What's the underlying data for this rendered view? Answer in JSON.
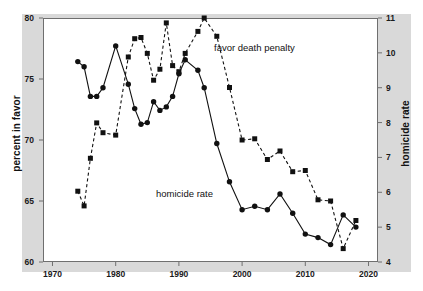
{
  "chart_data": {
    "type": "line",
    "title": "",
    "subtitle": "",
    "xlabel": "",
    "xlim": [
      1968.5,
      2021.5
    ],
    "xticks": [
      1970,
      1980,
      1990,
      2000,
      2010,
      2020
    ],
    "grid": false,
    "legend_position": "inline-annotations",
    "axes": [
      {
        "id": "left",
        "label": "percent in favor",
        "ylim": [
          60,
          80
        ],
        "yticks": [
          60,
          65,
          70,
          75,
          80
        ],
        "side": "left"
      },
      {
        "id": "right",
        "label": "homicide rate",
        "ylim": [
          4,
          11
        ],
        "yticks": [
          4,
          5,
          6,
          7,
          8,
          9,
          10,
          11
        ],
        "side": "right"
      }
    ],
    "series": [
      {
        "name": "favor death penalty",
        "axis": "left",
        "marker": "square",
        "linestyle": "dashed",
        "color": "#111111",
        "annotation": "favor death penalty",
        "points": [
          {
            "x": 1974,
            "y": 65.8
          },
          {
            "x": 1975,
            "y": 64.6
          },
          {
            "x": 1976,
            "y": 68.5
          },
          {
            "x": 1977,
            "y": 71.4
          },
          {
            "x": 1978,
            "y": 70.6
          },
          {
            "x": 1980,
            "y": 70.4
          },
          {
            "x": 1982,
            "y": 76.8
          },
          {
            "x": 1983,
            "y": 78.3
          },
          {
            "x": 1984,
            "y": 78.4
          },
          {
            "x": 1985,
            "y": 77.1
          },
          {
            "x": 1986,
            "y": 74.9
          },
          {
            "x": 1987,
            "y": 75.8
          },
          {
            "x": 1988,
            "y": 79.6
          },
          {
            "x": 1989,
            "y": 76.1
          },
          {
            "x": 1990,
            "y": 75.6
          },
          {
            "x": 1991,
            "y": 77.1
          },
          {
            "x": 1993,
            "y": 78.9
          },
          {
            "x": 1994,
            "y": 80.0
          },
          {
            "x": 1996,
            "y": 78.5
          },
          {
            "x": 1998,
            "y": 74.3
          },
          {
            "x": 2000,
            "y": 70.0
          },
          {
            "x": 2002,
            "y": 70.1
          },
          {
            "x": 2004,
            "y": 68.4
          },
          {
            "x": 2006,
            "y": 69.1
          },
          {
            "x": 2008,
            "y": 67.4
          },
          {
            "x": 2010,
            "y": 67.5
          },
          {
            "x": 2012,
            "y": 65.1
          },
          {
            "x": 2014,
            "y": 65.0
          },
          {
            "x": 2016,
            "y": 61.1
          },
          {
            "x": 2018,
            "y": 63.4
          }
        ]
      },
      {
        "name": "homicide rate",
        "axis": "right",
        "marker": "circle",
        "linestyle": "solid",
        "color": "#111111",
        "annotation": "homicide rate",
        "points": [
          {
            "x": 1974,
            "y": 9.75
          },
          {
            "x": 1975,
            "y": 9.6
          },
          {
            "x": 1976,
            "y": 8.75
          },
          {
            "x": 1977,
            "y": 8.75
          },
          {
            "x": 1978,
            "y": 9.0
          },
          {
            "x": 1980,
            "y": 10.2
          },
          {
            "x": 1982,
            "y": 9.1
          },
          {
            "x": 1983,
            "y": 8.4
          },
          {
            "x": 1984,
            "y": 7.95
          },
          {
            "x": 1985,
            "y": 8.0
          },
          {
            "x": 1986,
            "y": 8.6
          },
          {
            "x": 1987,
            "y": 8.35
          },
          {
            "x": 1988,
            "y": 8.45
          },
          {
            "x": 1989,
            "y": 8.75
          },
          {
            "x": 1990,
            "y": 9.4
          },
          {
            "x": 1991,
            "y": 9.8
          },
          {
            "x": 1993,
            "y": 9.5
          },
          {
            "x": 1994,
            "y": 9.0
          },
          {
            "x": 1996,
            "y": 7.4
          },
          {
            "x": 1998,
            "y": 6.3
          },
          {
            "x": 2000,
            "y": 5.5
          },
          {
            "x": 2002,
            "y": 5.6
          },
          {
            "x": 2004,
            "y": 5.5
          },
          {
            "x": 2006,
            "y": 5.95
          },
          {
            "x": 2008,
            "y": 5.4
          },
          {
            "x": 2010,
            "y": 4.8
          },
          {
            "x": 2012,
            "y": 4.7
          },
          {
            "x": 2014,
            "y": 4.5
          },
          {
            "x": 2016,
            "y": 5.35
          },
          {
            "x": 2018,
            "y": 5.0
          }
        ]
      }
    ]
  }
}
